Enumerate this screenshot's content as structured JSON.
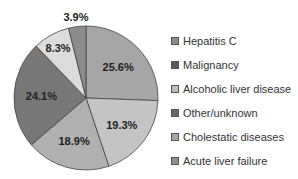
{
  "chart_data": {
    "type": "pie",
    "title": "",
    "slices": [
      {
        "label": "Hepatitis C",
        "value": 25.6,
        "display": "25.6%",
        "color": "#a6a6a6"
      },
      {
        "label": "Alcoholic liver disease",
        "value": 19.3,
        "display": "19.3%",
        "color": "#c4c4c4"
      },
      {
        "label": "Cholestatic diseases",
        "value": 18.9,
        "display": "18.9%",
        "color": "#b0b0b0"
      },
      {
        "label": "Other/unknown",
        "value": 24.1,
        "display": "24.1%",
        "color": "#777777"
      },
      {
        "label": "Malignancy",
        "value": 8.3,
        "display": "8.3%",
        "color": "#dcdcdc"
      },
      {
        "label": "Acute liver failure",
        "value": 3.9,
        "display": "3.9%",
        "color": "#8c8c8c"
      }
    ],
    "start_angle_deg": 0,
    "direction": "clockwise",
    "legend_position": "right"
  },
  "legend": {
    "items": [
      {
        "label": "Hepatitis C",
        "color": "#8a8a8a"
      },
      {
        "label": "Malignancy",
        "color": "#5a5a5a"
      },
      {
        "label": "Alcoholic liver disease",
        "color": "#bdbdbd"
      },
      {
        "label": "Other/unknown",
        "color": "#666666"
      },
      {
        "label": "Cholestatic diseases",
        "color": "#a8a8a8"
      },
      {
        "label": "Acute liver failure",
        "color": "#8f8f8f"
      }
    ]
  }
}
